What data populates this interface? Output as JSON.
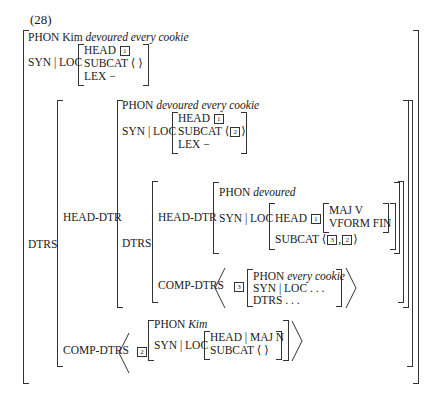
{
  "example_number": "(28)",
  "root": {
    "phon_label": "PHON",
    "phon_plain": "Kim",
    "phon_italic": "devoured every cookie",
    "synloc_label": "SYN | LOC",
    "head_label": "HEAD",
    "head_tag": "1",
    "subcat_label": "SUBCAT",
    "subcat_value": "⟨   ⟩",
    "lex_label": "LEX",
    "lex_value": "−",
    "dtrs_label": "DTRS"
  },
  "head_dtr": {
    "label": "HEAD-DTR",
    "phon_label": "PHON",
    "phon_italic": "devoured every cookie",
    "synloc_label": "SYN | LOC",
    "head_label": "HEAD",
    "head_tag": "1",
    "subcat_label": "SUBCAT",
    "subcat_open": "⟨",
    "subcat_tag": "2",
    "subcat_close": "⟩",
    "lex_label": "LEX",
    "lex_value": "−",
    "dtrs_label": "DTRS",
    "inner_head_dtr": {
      "label": "HEAD-DTR",
      "phon_label": "PHON",
      "phon_italic": "devoured",
      "synloc_label": "SYN | LOC",
      "head_label": "HEAD",
      "head_tag": "1",
      "maj": "MAJ V",
      "vform": "VFORM FIN",
      "subcat_label": "SUBCAT",
      "subcat_open": "⟨",
      "subcat_tag_a": "3",
      "subcat_sep": ",",
      "subcat_tag_b": "2",
      "subcat_close": "⟩"
    },
    "inner_comp_dtrs": {
      "label": "COMP-DTRS",
      "tag": "3",
      "phon_label": "PHON",
      "phon_italic": "every cookie",
      "synloc": "SYN | LOC . . .",
      "dtrs": "DTRS . . ."
    }
  },
  "comp_dtrs": {
    "label": "COMP-DTRS",
    "tag": "2",
    "phon_label": "PHON",
    "phon_italic": "Kim",
    "synloc_label": "SYN | LOC",
    "head_maj": "HEAD | MAJ N",
    "subcat_label": "SUBCAT",
    "subcat_value": "⟨   ⟩"
  }
}
